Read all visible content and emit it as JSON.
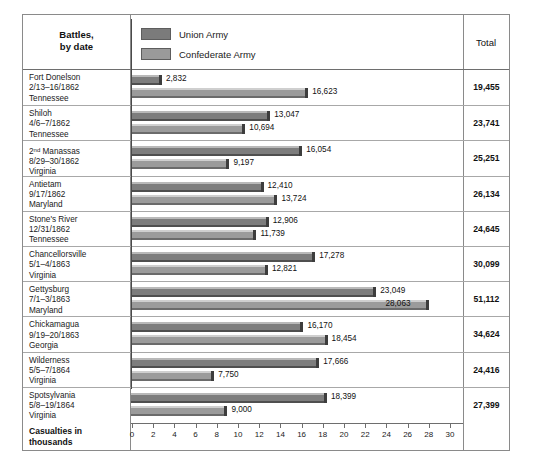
{
  "figure": {
    "header": {
      "battles_label": "Battles,\nby date",
      "total_label": "Total"
    },
    "legend": [
      {
        "label": "Union Army",
        "color": "#7b7b7b",
        "series": "union"
      },
      {
        "label": "Confederate Army",
        "color": "#9a9a9a",
        "series": "confederate"
      }
    ],
    "axis_caption": "Casualties in\nthousands"
  },
  "chart_data": {
    "type": "bar",
    "orientation": "horizontal",
    "title": "",
    "xlabel": "Casualties in thousands",
    "ylabel": "Battles, by date",
    "xlim": [
      0,
      30
    ],
    "xticks": [
      0,
      2,
      4,
      6,
      8,
      10,
      12,
      14,
      16,
      18,
      20,
      22,
      24,
      26,
      28,
      30
    ],
    "grid": false,
    "legend_position": "top",
    "units": "thousands",
    "categories": [
      "Fort Donelson 2/13–16/1862 Tennessee",
      "Shiloh 4/6–7/1862 Tennessee",
      "2nd Manassas 8/29–30/1862 Virginia",
      "Antietam 9/17/1862 Maryland",
      "Stone's River 12/31/1862 Tennessee",
      "Chancellorsville 5/1–4/1863 Virginia",
      "Gettysburg 7/1–3/1863 Maryland",
      "Chickamagua 9/19–20/1863 Georgia",
      "Wilderness 5/5–7/1864 Virginia",
      "Spotsylvania 5/8–19/1864 Virginia"
    ],
    "series": [
      {
        "name": "Union Army",
        "color": "#7b7b7b",
        "values": [
          2832,
          13047,
          16054,
          12410,
          12906,
          17278,
          23049,
          16170,
          17666,
          18399
        ]
      },
      {
        "name": "Confederate Army",
        "color": "#9a9a9a",
        "values": [
          16623,
          10694,
          9197,
          13724,
          11739,
          12821,
          28063,
          18454,
          7750,
          9000
        ]
      }
    ],
    "totals": [
      19455,
      23741,
      25251,
      26134,
      24645,
      30099,
      51112,
      34624,
      24416,
      27399
    ]
  },
  "rows": [
    {
      "name": "Fort Donelson",
      "date": "2/13–16/1862",
      "place": "Tennessee",
      "union": 2832,
      "union_label": "2,832",
      "confederate": 16623,
      "confederate_label": "16,623",
      "total_label": "19,455"
    },
    {
      "name": "Shiloh",
      "date": "4/6–7/1862",
      "place": "Tennessee",
      "union": 13047,
      "union_label": "13,047",
      "confederate": 10694,
      "confederate_label": "10,694",
      "total_label": "23,741"
    },
    {
      "name": "2nd Manassas",
      "name_prefix": "2",
      "name_sup": "nd",
      "name_rest": " Manassas",
      "date": "8/29–30/1862",
      "place": "Virginia",
      "union": 16054,
      "union_label": "16,054",
      "confederate": 9197,
      "confederate_label": "9,197",
      "total_label": "25,251"
    },
    {
      "name": "Antietam",
      "date": "9/17/1862",
      "place": "Maryland",
      "union": 12410,
      "union_label": "12,410",
      "confederate": 13724,
      "confederate_label": "13,724",
      "total_label": "26,134"
    },
    {
      "name": "Stone's River",
      "date": "12/31/1862",
      "place": "Tennessee",
      "union": 12906,
      "union_label": "12,906",
      "confederate": 11739,
      "confederate_label": "11,739",
      "total_label": "24,645"
    },
    {
      "name": "Chancellorsville",
      "date": "5/1–4/1863",
      "place": "Virginia",
      "union": 17278,
      "union_label": "17,278",
      "confederate": 12821,
      "confederate_label": "12,821",
      "total_label": "30,099"
    },
    {
      "name": "Gettysburg",
      "date": "7/1–3/1863",
      "place": "Maryland",
      "union": 23049,
      "union_label": "23,049",
      "confederate": 28063,
      "confederate_label": "28,063",
      "confederate_label_inside": true,
      "total_label": "51,112"
    },
    {
      "name": "Chickamagua",
      "date": "9/19–20/1863",
      "place": "Georgia",
      "union": 16170,
      "union_label": "16,170",
      "confederate": 18454,
      "confederate_label": "18,454",
      "total_label": "34,624"
    },
    {
      "name": "Wilderness",
      "date": "5/5–7/1864",
      "place": "Virginia",
      "union": 17666,
      "union_label": "17,666",
      "confederate": 7750,
      "confederate_label": "7,750",
      "total_label": "24,416"
    },
    {
      "name": "Spotsylvania",
      "date": "5/8–19/1864",
      "place": "Virginia",
      "union": 18399,
      "union_label": "18,399",
      "confederate": 9000,
      "confederate_label": "9,000",
      "total_label": "27,399"
    }
  ]
}
